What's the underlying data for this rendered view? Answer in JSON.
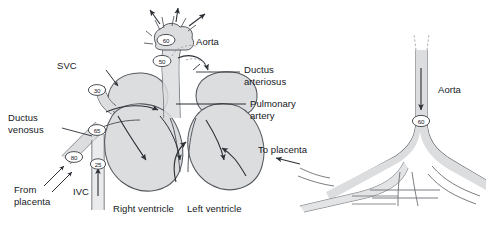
{
  "figure": {
    "type": "anatomical-schematic",
    "panels": [
      "heart-panel",
      "placenta-panel"
    ]
  },
  "labels": {
    "svc": "SVC",
    "aorta_left": "Aorta",
    "ductus_arteriosus_line1": "Ductus",
    "ductus_arteriosus_line2": "arteriosus",
    "pulmonary_artery_line1": "Pulmonary",
    "pulmonary_artery_line2": "artery",
    "ductus_venosus_line1": "Ductus",
    "ductus_venosus_line2": "venosus",
    "from_placenta_line1": "From",
    "from_placenta_line2": "placenta",
    "ivc": "IVC",
    "right_ventricle": "Right ventricle",
    "left_ventricle": "Left ventricle",
    "to_placenta": "To placenta",
    "aorta_right": "Aorta"
  },
  "oxygen_saturation_markers": [
    {
      "id": "marker-aortic-arch",
      "value": "60",
      "site": "aortic arch / ascending aorta"
    },
    {
      "id": "marker-pulmonary-trunk",
      "value": "50",
      "site": "pulmonary trunk / ductus arteriosus"
    },
    {
      "id": "marker-svc",
      "value": "30",
      "site": "superior vena cava"
    },
    {
      "id": "marker-ductus-venosus-entry",
      "value": "65",
      "site": "right atrium inflow"
    },
    {
      "id": "marker-umbilical-vein",
      "value": "80",
      "site": "ductus venosus / umbilical vein"
    },
    {
      "id": "marker-ivc",
      "value": "25",
      "site": "inferior vena cava"
    },
    {
      "id": "marker-descending-aorta",
      "value": "60",
      "site": "descending aorta"
    }
  ],
  "colors": {
    "stroke": "#3a3f46",
    "fill": "#dcdddf",
    "text": "#15181c",
    "background": "#ffffff"
  }
}
